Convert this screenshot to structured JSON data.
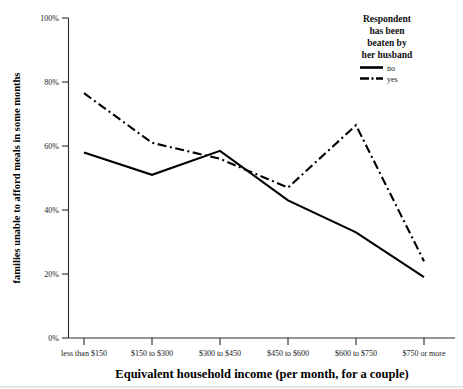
{
  "chart_data": {
    "type": "line",
    "title": "",
    "xlabel": "Equivalent household income (per month, for a couple)",
    "ylabel": "families unable to afford meals in some months",
    "categories": [
      "less than $150",
      "$150 to $300",
      "$300 to $450",
      "$450 to $600",
      "$600 to $750",
      "$750 or more"
    ],
    "series": [
      {
        "name": "no",
        "style": "solid",
        "values": [
          58,
          51,
          58.5,
          43,
          33,
          19
        ]
      },
      {
        "name": "yes",
        "style": "dash-dot",
        "values": [
          76.5,
          61,
          56,
          47,
          66.5,
          24
        ]
      }
    ],
    "ylim": [
      0,
      100
    ],
    "yticks": [
      0,
      20,
      40,
      60,
      80,
      100
    ],
    "ytick_labels": [
      "0%",
      "20%",
      "40%",
      "60%",
      "80%",
      "100%"
    ],
    "grid": false,
    "legend_position": "top-right"
  },
  "legend": {
    "title_lines": [
      "Respondent",
      "has been",
      "beaten by",
      "her husband"
    ],
    "entries": [
      {
        "label": "no"
      },
      {
        "label": "yes"
      }
    ]
  },
  "colors": {
    "series": "#000000",
    "axis": "#2b2b2b",
    "background": "#ffffff",
    "text": "#111111"
  }
}
